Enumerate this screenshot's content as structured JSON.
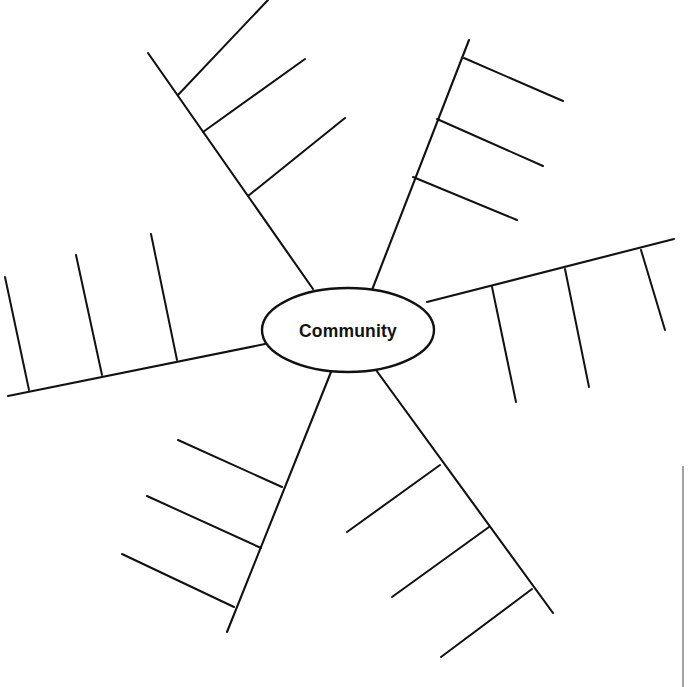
{
  "diagram": {
    "title": "Community",
    "type": "radial-concept-map",
    "canvas": {
      "width": 690,
      "height": 687,
      "background": "#ffffff"
    },
    "ink_color": "#111111",
    "stray_line_color": "#8a8a8a",
    "center": {
      "label": "Community",
      "cx": 348,
      "cy": 330,
      "rx": 86,
      "ry": 42
    },
    "branches": [
      {
        "name": "branch-upper-left",
        "label": "",
        "start": {
          "x": 313,
          "y": 289
        },
        "end": {
          "x": 148,
          "y": 53
        },
        "ribs": [
          {
            "name": "rib-upper-left-1",
            "label": "",
            "start": {
              "x": 203,
              "y": 132
            },
            "end": {
              "x": 305,
              "y": 59
            }
          },
          {
            "name": "rib-upper-left-2",
            "label": "",
            "start": {
              "x": 248,
              "y": 196
            },
            "end": {
              "x": 345,
              "y": 118
            }
          },
          {
            "name": "rib-upper-left-3",
            "label": "",
            "start": {
              "x": 178,
              "y": 95
            },
            "end": {
              "x": 268,
              "y": 0
            }
          }
        ]
      },
      {
        "name": "branch-upper-right",
        "label": "",
        "start": {
          "x": 372,
          "y": 290
        },
        "end": {
          "x": 469,
          "y": 40
        },
        "ribs": [
          {
            "name": "rib-upper-right-1",
            "label": "",
            "start": {
              "x": 464,
              "y": 58
            },
            "end": {
              "x": 563,
              "y": 101
            }
          },
          {
            "name": "rib-upper-right-2",
            "label": "",
            "start": {
              "x": 437,
              "y": 119
            },
            "end": {
              "x": 543,
              "y": 166
            }
          },
          {
            "name": "rib-upper-right-3",
            "label": "",
            "start": {
              "x": 413,
              "y": 177
            },
            "end": {
              "x": 517,
              "y": 220
            }
          }
        ]
      },
      {
        "name": "branch-right",
        "label": "",
        "start": {
          "x": 427,
          "y": 302
        },
        "end": {
          "x": 674,
          "y": 239
        },
        "ribs": [
          {
            "name": "rib-right-1",
            "label": "",
            "start": {
              "x": 492,
              "y": 287
            },
            "end": {
              "x": 516,
              "y": 402
            }
          },
          {
            "name": "rib-right-2",
            "label": "",
            "start": {
              "x": 565,
              "y": 269
            },
            "end": {
              "x": 589,
              "y": 387
            }
          },
          {
            "name": "rib-right-3",
            "label": "",
            "start": {
              "x": 641,
              "y": 250
            },
            "end": {
              "x": 665,
              "y": 330
            }
          }
        ]
      },
      {
        "name": "branch-lower-right",
        "label": "",
        "start": {
          "x": 376,
          "y": 370
        },
        "end": {
          "x": 553,
          "y": 613
        },
        "ribs": [
          {
            "name": "rib-lower-right-1",
            "label": "",
            "start": {
              "x": 440,
              "y": 465
            },
            "end": {
              "x": 347,
              "y": 532
            }
          },
          {
            "name": "rib-lower-right-2",
            "label": "",
            "start": {
              "x": 489,
              "y": 527
            },
            "end": {
              "x": 392,
              "y": 597
            }
          },
          {
            "name": "rib-lower-right-3",
            "label": "",
            "start": {
              "x": 532,
              "y": 589
            },
            "end": {
              "x": 441,
              "y": 657
            }
          }
        ]
      },
      {
        "name": "branch-lower-left",
        "label": "",
        "start": {
          "x": 331,
          "y": 372
        },
        "end": {
          "x": 227,
          "y": 632
        },
        "ribs": [
          {
            "name": "rib-lower-left-1",
            "label": "",
            "start": {
              "x": 282,
              "y": 487
            },
            "end": {
              "x": 178,
              "y": 440
            }
          },
          {
            "name": "rib-lower-left-2",
            "label": "",
            "start": {
              "x": 261,
              "y": 548
            },
            "end": {
              "x": 147,
              "y": 496
            }
          },
          {
            "name": "rib-lower-left-3",
            "label": "",
            "start": {
              "x": 234,
              "y": 607
            },
            "end": {
              "x": 122,
              "y": 554
            }
          }
        ]
      },
      {
        "name": "branch-left",
        "label": "",
        "start": {
          "x": 265,
          "y": 344
        },
        "end": {
          "x": 8,
          "y": 396
        },
        "ribs": [
          {
            "name": "rib-left-1",
            "label": "",
            "start": {
              "x": 177,
              "y": 360
            },
            "end": {
              "x": 151,
              "y": 234
            }
          },
          {
            "name": "rib-left-2",
            "label": "",
            "start": {
              "x": 102,
              "y": 375
            },
            "end": {
              "x": 76,
              "y": 255
            }
          },
          {
            "name": "rib-left-3",
            "label": "",
            "start": {
              "x": 29,
              "y": 390
            },
            "end": {
              "x": 5,
              "y": 277
            }
          }
        ]
      }
    ],
    "stray_marks": [
      {
        "name": "stray-vertical-line",
        "start": {
          "x": 683,
          "y": 466
        },
        "end": {
          "x": 683,
          "y": 687
        }
      }
    ]
  }
}
